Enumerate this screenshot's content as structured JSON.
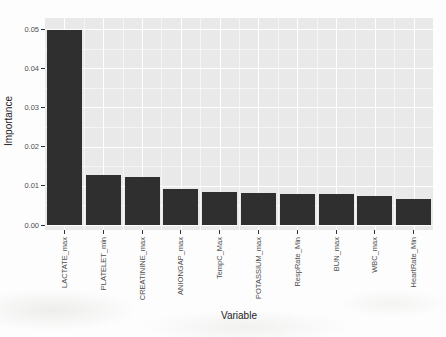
{
  "chart_data": {
    "type": "bar",
    "title": "",
    "xlabel": "Variable",
    "ylabel": "Importance",
    "categories": [
      "LACTATE_max",
      "PLATELET_min",
      "CREATININE_max",
      "ANIONGAP_max",
      "TempC_Max",
      "POTASSIUM_max",
      "RespRate_Min",
      "BUN_max",
      "WBC_max",
      "HeartRate_Min"
    ],
    "values": [
      0.0498,
      0.0127,
      0.0122,
      0.0092,
      0.0084,
      0.0081,
      0.0079,
      0.0079,
      0.0073,
      0.0067
    ],
    "yticks": [
      0,
      0.01,
      0.02,
      0.03,
      0.04,
      0.05
    ],
    "ytick_labels": [
      "0.00",
      "0.01",
      "0.02",
      "0.03",
      "0.04",
      "0.05"
    ],
    "ylim": [
      0,
      0.0528
    ],
    "grid": "major and minor, horizontal and vertical, white lines on grey panel",
    "legend": "none",
    "style": {
      "bar_color": "#2f2f2f",
      "panel_bg": "#e9e9e9",
      "grid_color": "#ffffff",
      "tick_label_color": "#4d4d4d",
      "axis_title_color": "#1c1c1c",
      "tick_mark_color": "#333333"
    }
  }
}
